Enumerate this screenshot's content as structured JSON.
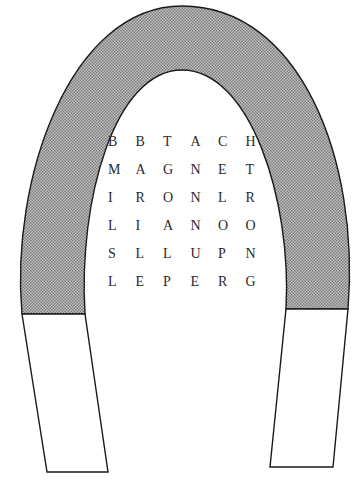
{
  "puzzle": {
    "type": "word-search",
    "shape": "horseshoe-magnet",
    "grid": [
      [
        "B",
        "B",
        "T",
        "A",
        "C",
        "H"
      ],
      [
        "M",
        "A",
        "G",
        "N",
        "E",
        "T"
      ],
      [
        "I",
        "R",
        "O",
        "N",
        "L",
        "R"
      ],
      [
        "L",
        "I",
        "A",
        "N",
        "O",
        "O"
      ],
      [
        "S",
        "L",
        "L",
        "U",
        "P",
        "N"
      ],
      [
        "L",
        "E",
        "P",
        "E",
        "R",
        "G"
      ]
    ]
  },
  "colors": {
    "stroke": "#1a1a1a",
    "shade": "#9a9a9a",
    "background": "#ffffff"
  }
}
